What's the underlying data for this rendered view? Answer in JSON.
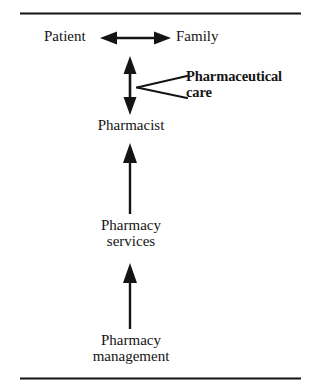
{
  "figure": {
    "type": "hierarchy-diagram",
    "background_color": "#ffffff",
    "ink_color": "#141414",
    "rules": [
      {
        "name": "top-rule",
        "y": 13,
        "x1": 20,
        "x2": 301,
        "thickness": 2
      },
      {
        "name": "bottom-rule",
        "y": 378,
        "x1": 20,
        "x2": 301,
        "thickness": 2
      }
    ],
    "nodes": {
      "patient": {
        "label": "Patient"
      },
      "family": {
        "label": "Family"
      },
      "pharmacist": {
        "label": "Pharmacist"
      },
      "pharmacy_services": {
        "line1": "Pharmacy",
        "line2": "services"
      },
      "pharmacy_management": {
        "line1": "Pharmacy",
        "line2": "management"
      }
    },
    "callout": {
      "line1": "Pharmaceutical",
      "line2": "care",
      "bold": true
    },
    "connectors": [
      {
        "name": "patient-family-arrow",
        "style": "double-headed",
        "orientation": "horizontal",
        "from": "patient",
        "to": "family"
      },
      {
        "name": "patient-family-pharmacist-arrow",
        "style": "double-headed",
        "orientation": "vertical",
        "from": "pharmacist",
        "to": "patient-family"
      },
      {
        "name": "services-pharmacist-arrow",
        "style": "single-headed",
        "orientation": "vertical-up",
        "from": "pharmacy_services",
        "to": "pharmacist"
      },
      {
        "name": "management-services-arrow",
        "style": "single-headed",
        "orientation": "vertical-up",
        "from": "pharmacy_management",
        "to": "pharmacy_services"
      },
      {
        "name": "callout-leader-upper",
        "style": "plain-line",
        "from": "callout",
        "to": "patient-family-pharmacist-arrow"
      },
      {
        "name": "callout-leader-lower",
        "style": "plain-line",
        "from": "callout",
        "to": "patient-family-pharmacist-arrow"
      }
    ]
  }
}
